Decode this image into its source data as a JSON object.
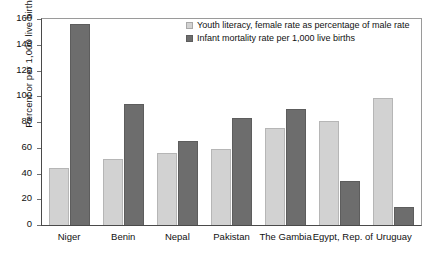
{
  "chart_data": {
    "type": "bar",
    "title": "",
    "xlabel": "",
    "ylabel": "Percent or per 1,000 live births",
    "ylim": [
      0,
      160
    ],
    "yticks": [
      0,
      20,
      40,
      60,
      80,
      100,
      120,
      140,
      160
    ],
    "grid": false,
    "legend_position": "top-center",
    "categories": [
      "Niger",
      "Benin",
      "Nepal",
      "Pakistan",
      "The Gambia",
      "Egypt, Rep. of",
      "Uruguay"
    ],
    "series": [
      {
        "name": "Youth literacy, female rate as percentage of male rate",
        "color": "#d2d2d2",
        "values": [
          44,
          51,
          56,
          59,
          75,
          81,
          99
        ]
      },
      {
        "name": "Infant mortality rate per 1,000 live births",
        "color": "#6d6d6d",
        "values": [
          156,
          94,
          65,
          83,
          90,
          34,
          14
        ]
      }
    ]
  },
  "legend": {
    "items": [
      {
        "label": "Youth literacy, female rate as percentage of male rate",
        "swatch": "light"
      },
      {
        "label": "Infant mortality rate per 1,000 live births",
        "swatch": "dark"
      }
    ]
  }
}
